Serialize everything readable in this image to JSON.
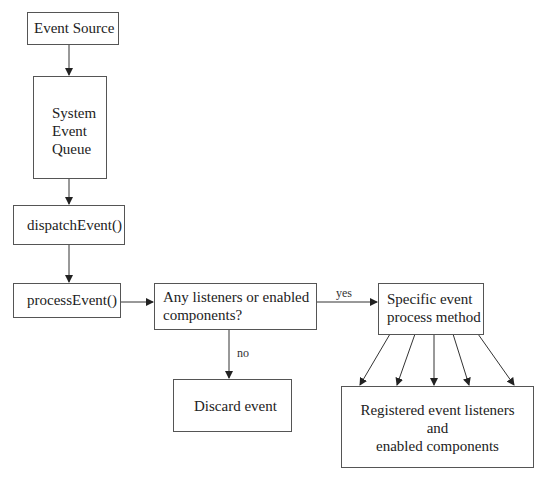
{
  "diagram": {
    "nodes": [
      {
        "id": "event-source",
        "label": "Event Source"
      },
      {
        "id": "system-event-queue",
        "lines": [
          "System",
          "Event",
          "Queue"
        ]
      },
      {
        "id": "dispatch-event",
        "label": "dispatchEvent()"
      },
      {
        "id": "process-event",
        "label": "processEvent()"
      },
      {
        "id": "decision",
        "lines": [
          "Any listeners or enabled",
          "components?"
        ]
      },
      {
        "id": "specific-method",
        "lines": [
          "Specific event",
          "process method"
        ]
      },
      {
        "id": "discard-event",
        "label": "Discard event"
      },
      {
        "id": "registered",
        "lines": [
          "Registered event listeners",
          "and",
          "enabled components"
        ]
      }
    ],
    "edges": [
      {
        "from": "event-source",
        "to": "system-event-queue",
        "label": ""
      },
      {
        "from": "system-event-queue",
        "to": "dispatch-event",
        "label": ""
      },
      {
        "from": "dispatch-event",
        "to": "process-event",
        "label": ""
      },
      {
        "from": "process-event",
        "to": "decision",
        "label": ""
      },
      {
        "from": "decision",
        "to": "specific-method",
        "label": "yes"
      },
      {
        "from": "decision",
        "to": "discard-event",
        "label": "no"
      },
      {
        "from": "specific-method",
        "to": "registered",
        "label": "",
        "count": 5
      }
    ],
    "edge_labels": {
      "yes": "yes",
      "no": "no"
    },
    "colors": {
      "stroke": "#555555",
      "text": "#222222",
      "background": "#ffffff"
    }
  }
}
